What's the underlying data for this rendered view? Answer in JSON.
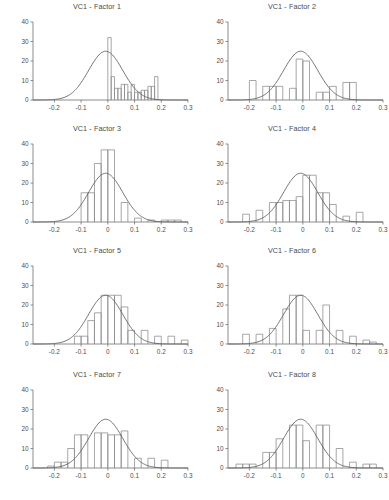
{
  "figure": {
    "panel_columns": 2,
    "panel_rows": 4,
    "background_color": "#ffffff",
    "bar_stroke_color": "#8a8a8a",
    "curve_color": "#5c5c5c",
    "axis_color": "#6e6e6e"
  },
  "bottom_strip": {
    "text": ""
  },
  "chart_data": [
    {
      "type": "bar",
      "title": "VC1 - Factor 1",
      "xlabel": "",
      "ylabel": "",
      "xlim": [
        -0.28,
        0.3
      ],
      "ylim": [
        0,
        40
      ],
      "xticks": [
        -0.2,
        -0.1,
        0,
        0.1,
        0.2,
        0.3
      ],
      "xtick_labels": [
        "-0.2",
        "-0.1",
        "0",
        "0.1",
        "0.2",
        "0.3"
      ],
      "yticks": [
        0,
        10,
        20,
        30,
        40
      ],
      "ytick_labels": [
        "0",
        "10",
        "20",
        "30",
        "40"
      ],
      "grid": false,
      "legend": null,
      "bin_width": 0.0125,
      "bin_starts": [
        0.0,
        0.0125,
        0.025,
        0.0375,
        0.05,
        0.0625,
        0.075,
        0.0875,
        0.1,
        0.1125,
        0.125,
        0.1375,
        0.15,
        0.1625,
        0.175
      ],
      "values": [
        32,
        12,
        6,
        6,
        8,
        8,
        4,
        8,
        4,
        4,
        5,
        5,
        7,
        7,
        12
      ],
      "overlay_curve": {
        "type": "normal",
        "mean": -0.008,
        "sd": 0.064,
        "peak": 25
      }
    },
    {
      "type": "bar",
      "title": "VC1 - Factor 2",
      "xlabel": "",
      "ylabel": "",
      "xlim": [
        -0.28,
        0.3
      ],
      "ylim": [
        0,
        40
      ],
      "xticks": [
        -0.2,
        -0.1,
        0,
        0.1,
        0.2,
        0.3
      ],
      "xtick_labels": [
        "-0.2",
        "-0.1",
        "0",
        "0.1",
        "0.2",
        "0.3"
      ],
      "yticks": [
        0,
        10,
        20,
        30,
        40
      ],
      "ytick_labels": [
        "0",
        "10",
        "20",
        "30",
        "40"
      ],
      "grid": false,
      "legend": null,
      "bin_width": 0.025,
      "bin_starts": [
        -0.2,
        -0.15,
        -0.125,
        -0.1,
        -0.05,
        -0.025,
        0.0,
        0.05,
        0.075,
        0.1,
        0.15,
        0.175
      ],
      "values": [
        10,
        7,
        7,
        7,
        6,
        21,
        20,
        4,
        4,
        7,
        9,
        9
      ],
      "overlay_curve": {
        "type": "normal",
        "mean": -0.008,
        "sd": 0.064,
        "peak": 25
      }
    },
    {
      "type": "bar",
      "title": "VC1 - Factor 3",
      "xlabel": "",
      "ylabel": "",
      "xlim": [
        -0.28,
        0.3
      ],
      "ylim": [
        0,
        40
      ],
      "xticks": [
        -0.2,
        -0.1,
        0,
        0.1,
        0.2,
        0.3
      ],
      "xtick_labels": [
        "-0.2",
        "-0.1",
        "0",
        "0.1",
        "0.2",
        "0.3"
      ],
      "yticks": [
        0,
        10,
        20,
        30,
        40
      ],
      "ytick_labels": [
        "0",
        "10",
        "20",
        "30",
        "40"
      ],
      "grid": false,
      "legend": null,
      "bin_width": 0.025,
      "bin_starts": [
        -0.1,
        -0.075,
        -0.05,
        -0.025,
        0.0,
        0.05,
        0.1,
        0.15,
        0.2,
        0.225,
        0.25
      ],
      "values": [
        15,
        15,
        30,
        37,
        37,
        10,
        2,
        1,
        1,
        1,
        1
      ],
      "overlay_curve": {
        "type": "normal",
        "mean": -0.008,
        "sd": 0.064,
        "peak": 25
      }
    },
    {
      "type": "bar",
      "title": "VC1 - Factor 4",
      "xlabel": "",
      "ylabel": "",
      "xlim": [
        -0.28,
        0.3
      ],
      "ylim": [
        0,
        40
      ],
      "xticks": [
        -0.2,
        -0.1,
        0,
        0.1,
        0.2,
        0.3
      ],
      "xtick_labels": [
        "-0.2",
        "-0.1",
        "0",
        "0.1",
        "0.2",
        "0.3"
      ],
      "yticks": [
        0,
        10,
        20,
        30,
        40
      ],
      "ytick_labels": [
        "0",
        "10",
        "20",
        "30",
        "40"
      ],
      "grid": false,
      "legend": null,
      "bin_width": 0.025,
      "bin_starts": [
        -0.225,
        -0.175,
        -0.125,
        -0.1,
        -0.075,
        -0.05,
        -0.025,
        0.0,
        0.025,
        0.05,
        0.075,
        0.1,
        0.15,
        0.2
      ],
      "values": [
        4,
        6,
        10,
        10,
        11,
        11,
        13,
        24,
        24,
        15,
        15,
        9,
        3,
        5
      ],
      "overlay_curve": {
        "type": "normal",
        "mean": -0.008,
        "sd": 0.064,
        "peak": 25
      }
    },
    {
      "type": "bar",
      "title": "VC1 - Factor 5",
      "xlabel": "",
      "ylabel": "",
      "xlim": [
        -0.28,
        0.3
      ],
      "ylim": [
        0,
        40
      ],
      "xticks": [
        -0.2,
        -0.1,
        0,
        0.1,
        0.2,
        0.3
      ],
      "xtick_labels": [
        "-0.2",
        "-0.1",
        "0",
        "0.1",
        "0.2",
        "0.3"
      ],
      "yticks": [
        0,
        10,
        20,
        30,
        40
      ],
      "ytick_labels": [
        "0",
        "10",
        "20",
        "30",
        "40"
      ],
      "grid": false,
      "legend": null,
      "bin_width": 0.025,
      "bin_starts": [
        -0.125,
        -0.1,
        -0.075,
        -0.05,
        -0.025,
        0.0,
        0.025,
        0.05,
        0.075,
        0.125,
        0.175,
        0.225,
        0.275
      ],
      "values": [
        4,
        4,
        12,
        16,
        25,
        25,
        25,
        19,
        7,
        7,
        4,
        4,
        2
      ],
      "overlay_curve": {
        "type": "normal",
        "mean": -0.008,
        "sd": 0.064,
        "peak": 25
      }
    },
    {
      "type": "bar",
      "title": "VC1 - Factor 6",
      "xlabel": "",
      "ylabel": "",
      "xlim": [
        -0.28,
        0.3
      ],
      "ylim": [
        0,
        40
      ],
      "xticks": [
        -0.2,
        -0.1,
        0,
        0.1,
        0.2,
        0.3
      ],
      "xtick_labels": [
        "-0.2",
        "-0.1",
        "0",
        "0.1",
        "0.2",
        "0.3"
      ],
      "yticks": [
        0,
        10,
        20,
        30,
        40
      ],
      "ytick_labels": [
        "0",
        "10",
        "20",
        "30",
        "40"
      ],
      "grid": false,
      "legend": null,
      "bin_width": 0.025,
      "bin_starts": [
        -0.225,
        -0.175,
        -0.125,
        -0.075,
        -0.05,
        -0.025,
        0.0,
        0.05,
        0.075,
        0.125,
        0.175,
        0.225,
        0.25
      ],
      "values": [
        5,
        5,
        8,
        18,
        25,
        25,
        7,
        7,
        20,
        7,
        4,
        2,
        1
      ],
      "overlay_curve": {
        "type": "normal",
        "mean": -0.008,
        "sd": 0.064,
        "peak": 25
      }
    },
    {
      "type": "bar",
      "title": "VC1 - Factor 7",
      "xlabel": "",
      "ylabel": "",
      "xlim": [
        -0.28,
        0.3
      ],
      "ylim": [
        0,
        40
      ],
      "xticks": [
        -0.2,
        -0.1,
        0,
        0.1,
        0.2,
        0.3
      ],
      "xtick_labels": [
        "-0.2",
        "-0.1",
        "0",
        "0.1",
        "0.2",
        "0.3"
      ],
      "yticks": [
        0,
        10,
        20,
        30,
        40
      ],
      "ytick_labels": [
        "0",
        "10",
        "20",
        "30",
        "40"
      ],
      "grid": false,
      "legend": null,
      "bin_width": 0.025,
      "bin_starts": [
        -0.225,
        -0.2,
        -0.175,
        -0.15,
        -0.125,
        -0.1,
        -0.05,
        -0.025,
        0.0,
        0.025,
        0.05,
        0.1,
        0.15,
        0.2
      ],
      "values": [
        1,
        3,
        3,
        10,
        17,
        17,
        18,
        18,
        17,
        17,
        19,
        5,
        5,
        4
      ],
      "overlay_curve": {
        "type": "normal",
        "mean": -0.008,
        "sd": 0.064,
        "peak": 25
      }
    },
    {
      "type": "bar",
      "title": "VC1 - Factor 8",
      "xlabel": "",
      "ylabel": "",
      "xlim": [
        -0.28,
        0.3
      ],
      "ylim": [
        0,
        40
      ],
      "xticks": [
        -0.2,
        -0.1,
        0,
        0.1,
        0.2,
        0.3
      ],
      "xtick_labels": [
        "-0.2",
        "-0.1",
        "0",
        "0.1",
        "0.2",
        "0.3"
      ],
      "yticks": [
        0,
        10,
        20,
        30,
        40
      ],
      "ytick_labels": [
        "0",
        "10",
        "20",
        "30",
        "40"
      ],
      "grid": false,
      "legend": null,
      "bin_width": 0.025,
      "bin_starts": [
        -0.25,
        -0.225,
        -0.2,
        -0.15,
        -0.125,
        -0.1,
        -0.05,
        -0.025,
        0.0,
        0.05,
        0.075,
        0.125,
        0.175,
        0.225,
        0.25
      ],
      "values": [
        2,
        2,
        2,
        8,
        8,
        15,
        22,
        22,
        14,
        22,
        22,
        10,
        3,
        2,
        2
      ],
      "overlay_curve": {
        "type": "normal",
        "mean": -0.008,
        "sd": 0.064,
        "peak": 25
      }
    }
  ]
}
